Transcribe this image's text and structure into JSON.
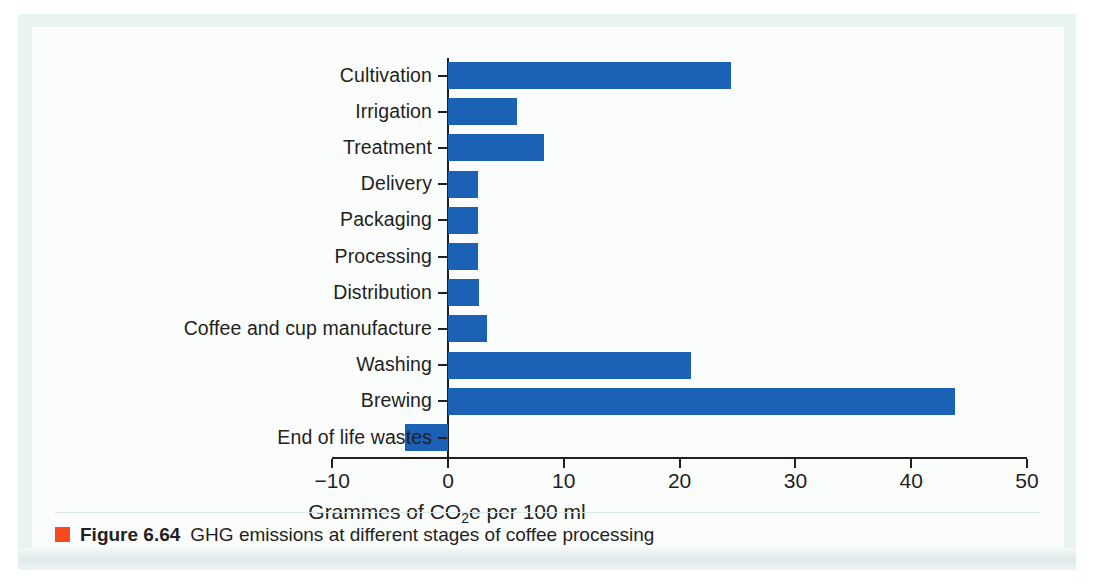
{
  "figure": {
    "caption_label": "Figure 6.64",
    "caption_text": "GHG emissions at different stages of coffee processing",
    "marker_color": "#f9491e"
  },
  "chart_data": {
    "type": "bar",
    "orientation": "horizontal",
    "title": "",
    "xlabel": "Grammes of CO2e per 100 ml",
    "xlabel_parts": {
      "before": "Grammes of CO",
      "sub": "2",
      "after": "e per 100 ml"
    },
    "ylabel": "",
    "categories": [
      "Cultivation",
      "Irrigation",
      "Treatment",
      "Delivery",
      "Packaging",
      "Processing",
      "Distribution",
      "Coffee and cup manufacture",
      "Washing",
      "Brewing",
      "End of life wastes"
    ],
    "values": [
      24.4,
      6.0,
      8.3,
      2.6,
      2.6,
      2.6,
      2.7,
      3.4,
      21.0,
      43.8,
      -3.7
    ],
    "xlim": [
      -10,
      50
    ],
    "xticks": [
      -10,
      0,
      10,
      20,
      30,
      40,
      50
    ],
    "xticklabels": [
      "−10",
      "0",
      "10",
      "20",
      "30",
      "40",
      "50"
    ],
    "grid": false,
    "legend": false,
    "bar_color": "#1b61b5"
  }
}
